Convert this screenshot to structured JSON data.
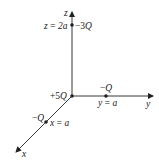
{
  "diagram": {
    "type": "3d-coordinate-axes-point-charges",
    "axes": {
      "x": {
        "label": "x"
      },
      "y": {
        "label": "y"
      },
      "z": {
        "label": "z"
      }
    },
    "charges": [
      {
        "name": "origin",
        "charge_prefix": "+5",
        "charge_sym": "Q",
        "position_label": ""
      },
      {
        "name": "z-charge",
        "charge_prefix": "−3",
        "charge_sym": "Q",
        "position_label": "z = 2a"
      },
      {
        "name": "y-charge",
        "charge_prefix": "−",
        "charge_sym": "Q",
        "position_label": "y = a"
      },
      {
        "name": "x-charge",
        "charge_prefix": "−",
        "charge_sym": "Q",
        "position_label": "x = a"
      }
    ],
    "colors": {
      "line": "#222222",
      "background": "#ffffff"
    }
  }
}
